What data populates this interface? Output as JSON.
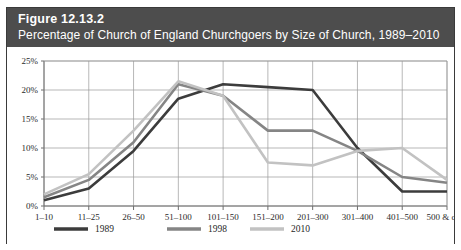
{
  "figure": {
    "number": "Figure 12.13.2",
    "title": "Percentage of Church of England Churchgoers by Size of Church, 1989–2010"
  },
  "colors": {
    "header_background": "#4d4d4d",
    "header_text": "#ffffff",
    "frame_border": "#3a3a3a",
    "grid": "#9a9a9a",
    "axis": "#6e6e6e",
    "series_1989": "#3c3c3c",
    "series_1998": "#858585",
    "series_2010": "#c2c2c2",
    "plot_background": "#ffffff"
  },
  "chart_data": {
    "type": "line",
    "title": "Percentage of Church of England Churchgoers by Size of Church, 1989–2010",
    "xlabel": "",
    "ylabel": "",
    "categories": [
      "1–10",
      "11–25",
      "26–50",
      "51–100",
      "101–150",
      "151–200",
      "201–300",
      "301–400",
      "401–500",
      "500 & over"
    ],
    "ytick_labels": [
      "0%",
      "5%",
      "10%",
      "15%",
      "20%",
      "25%"
    ],
    "ytick_values": [
      0,
      5,
      10,
      15,
      20,
      25
    ],
    "ylim": [
      0,
      25
    ],
    "grid": true,
    "legend_position": "bottom",
    "series": [
      {
        "name": "1989",
        "color": "#3c3c3c",
        "values": [
          1.0,
          3.0,
          9.5,
          18.5,
          21.0,
          20.5,
          20.0,
          10.0,
          2.5,
          2.5
        ]
      },
      {
        "name": "1998",
        "color": "#858585",
        "values": [
          1.5,
          4.5,
          11.0,
          21.0,
          19.0,
          13.0,
          13.0,
          9.5,
          5.0,
          4.0
        ]
      },
      {
        "name": "2010",
        "color": "#c2c2c2",
        "values": [
          2.0,
          5.5,
          13.0,
          21.5,
          19.0,
          7.5,
          7.0,
          9.5,
          10.0,
          4.5
        ]
      }
    ]
  }
}
